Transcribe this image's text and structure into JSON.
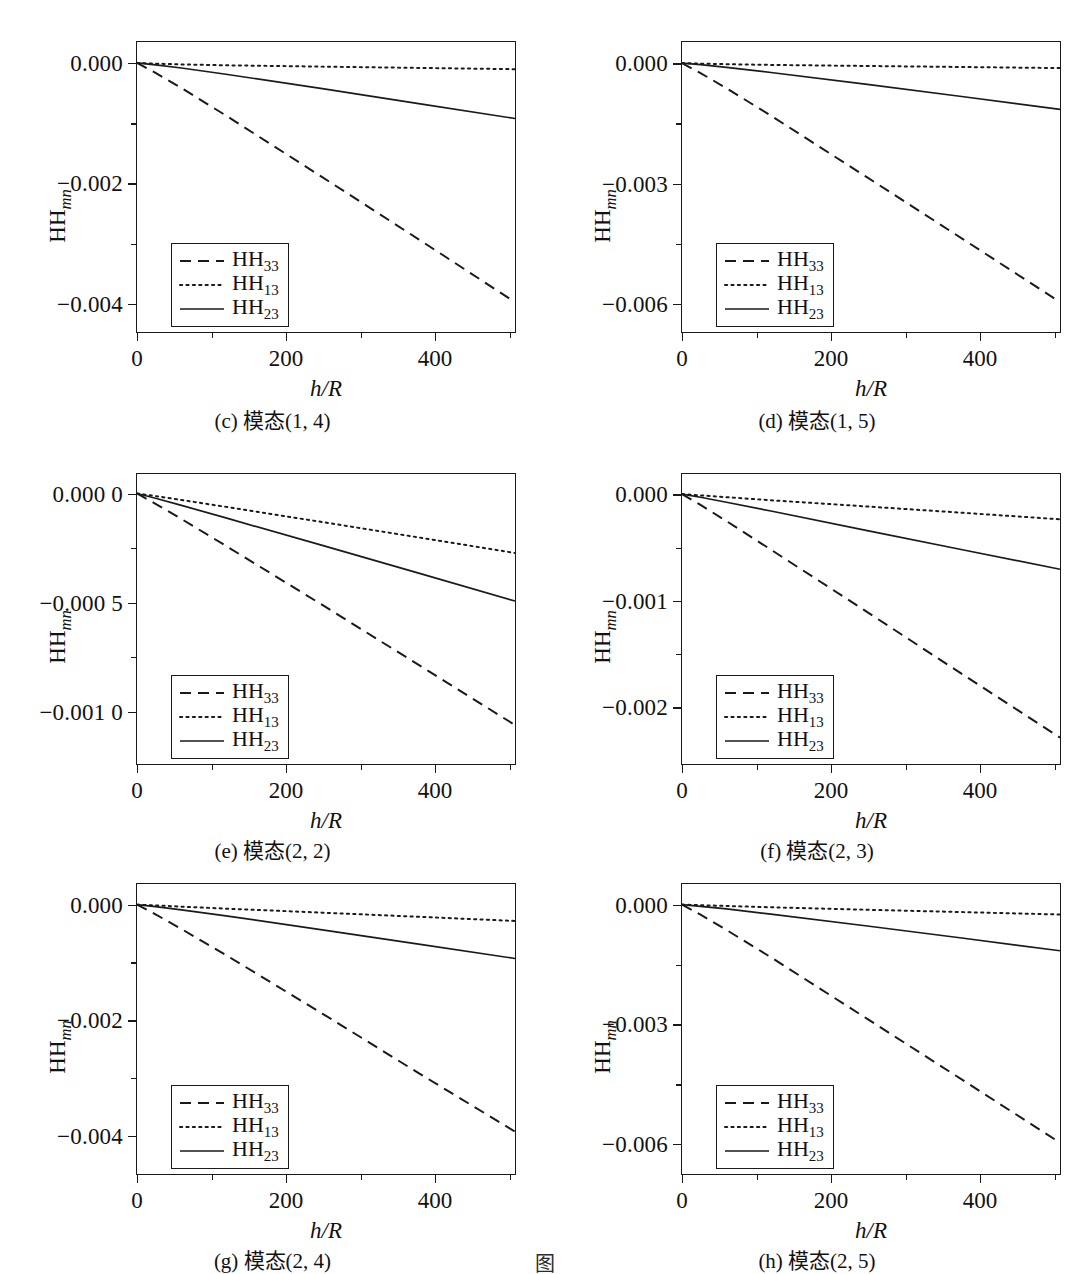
{
  "figure": {
    "bottom_caption": "图 ",
    "axis_y_title_base": "HH",
    "axis_y_title_sub": "mn",
    "axis_x_title": "h/R",
    "legend_labels": {
      "hh33_base": "HH",
      "hh33_sub": "33",
      "hh13_base": "HH",
      "hh13_sub": "13",
      "hh23_base": "HH",
      "hh23_sub": "23"
    },
    "line_color": "#1a1a1a"
  },
  "chart_data": [
    {
      "id": "c",
      "type": "line",
      "caption": "(c) 模态(1, 4)",
      "xlabel": "h/R",
      "ylabel": "HHmn",
      "xlim": [
        0,
        510
      ],
      "ylim": [
        -0.0045,
        0.00035
      ],
      "xticks": [
        0,
        200,
        400
      ],
      "xticklabels": [
        "0",
        "200",
        "400"
      ],
      "xminor": [
        100,
        300,
        500
      ],
      "yticks": [
        0.0,
        -0.002,
        -0.004
      ],
      "yticklabels": [
        "0.000",
        "−0.002",
        "−0.004"
      ],
      "yminor": [
        -0.001,
        -0.003
      ],
      "grid": false,
      "legend_position": "lower-left",
      "series": [
        {
          "name": "HH33",
          "style": "dashed",
          "x": [
            0,
            25,
            60,
            120,
            250,
            380,
            510
          ],
          "y": [
            0,
            -0.000165,
            -0.00042,
            -0.00088,
            -0.00191,
            -0.00295,
            -0.004
          ]
        },
        {
          "name": "HH13",
          "style": "dotted",
          "x": [
            0,
            25,
            60,
            120,
            250,
            380,
            510
          ],
          "y": [
            0,
            -1.2e-05,
            -2.5e-05,
            -4e-05,
            -6.2e-05,
            -8.3e-05,
            -0.000105
          ]
        },
        {
          "name": "HH23",
          "style": "solid",
          "x": [
            0,
            25,
            60,
            120,
            250,
            380,
            510
          ],
          "y": [
            0,
            -3.2e-05,
            -8.5e-05,
            -0.00019,
            -0.00043,
            -0.00068,
            -0.00093
          ]
        }
      ]
    },
    {
      "id": "d",
      "type": "line",
      "caption": "(d) 模态(1, 5)",
      "xlabel": "h/R",
      "ylabel": "HHmn",
      "xlim": [
        0,
        510
      ],
      "ylim": [
        -0.00675,
        0.00053
      ],
      "xticks": [
        0,
        200,
        400
      ],
      "xticklabels": [
        "0",
        "200",
        "400"
      ],
      "xminor": [
        100,
        300,
        500
      ],
      "yticks": [
        0.0,
        -0.003,
        -0.006
      ],
      "yticklabels": [
        "0.000",
        "−0.003",
        "−0.006"
      ],
      "yminor": [
        -0.0015,
        -0.0045
      ],
      "grid": false,
      "legend_position": "lower-left",
      "series": [
        {
          "name": "HH33",
          "style": "dashed",
          "x": [
            0,
            25,
            60,
            120,
            250,
            380,
            510
          ],
          "y": [
            0,
            -0.00025,
            -0.00063,
            -0.00132,
            -0.00287,
            -0.00443,
            -0.006
          ]
        },
        {
          "name": "HH13",
          "style": "dotted",
          "x": [
            0,
            25,
            60,
            120,
            250,
            380,
            510
          ],
          "y": [
            0,
            -1.3e-05,
            -2.7e-05,
            -4.5e-05,
            -7.2e-05,
            -9.8e-05,
            -0.000125
          ]
        },
        {
          "name": "HH23",
          "style": "solid",
          "x": [
            0,
            25,
            60,
            120,
            250,
            380,
            510
          ],
          "y": [
            0,
            -4e-05,
            -0.000105,
            -0.000235,
            -0.000535,
            -0.000845,
            -0.00116
          ]
        }
      ]
    },
    {
      "id": "e",
      "type": "line",
      "caption": "(e) 模态(2, 2)",
      "xlabel": "h/R",
      "ylabel": "HHmn",
      "xlim": [
        0,
        510
      ],
      "ylim": [
        -0.00125,
        9e-05
      ],
      "xticks": [
        0,
        200,
        400
      ],
      "xticklabels": [
        "0",
        "200",
        "400"
      ],
      "xminor": [
        100,
        300,
        500
      ],
      "yticks": [
        0.0,
        -0.0005,
        -0.001
      ],
      "yticklabels": [
        "0.000 0",
        "−0.000 5",
        "−0.001 0"
      ],
      "yminor": [
        -0.00025,
        -0.00075
      ],
      "grid": false,
      "legend_position": "lower-left",
      "series": [
        {
          "name": "HH33",
          "style": "dashed",
          "x": [
            0,
            25,
            60,
            120,
            250,
            380,
            510
          ],
          "y": [
            0,
            -4.8e-05,
            -0.000118,
            -0.000242,
            -0.000515,
            -0.000792,
            -0.00107
          ]
        },
        {
          "name": "HH13",
          "style": "dotted",
          "x": [
            0,
            25,
            60,
            120,
            250,
            380,
            510
          ],
          "y": [
            0,
            -1.2e-05,
            -3e-05,
            -6.2e-05,
            -0.000132,
            -0.000203,
            -0.000275
          ]
        },
        {
          "name": "HH23",
          "style": "solid",
          "x": [
            0,
            25,
            60,
            120,
            250,
            380,
            510
          ],
          "y": [
            0,
            -2.2e-05,
            -5.5e-05,
            -0.000113,
            -0.00024,
            -0.000368,
            -0.000497
          ]
        }
      ]
    },
    {
      "id": "f",
      "type": "line",
      "caption": "(f) 模态(2, 3)",
      "xlabel": "h/R",
      "ylabel": "HHmn",
      "xlim": [
        0,
        510
      ],
      "ylim": [
        -0.00255,
        0.00019
      ],
      "xticks": [
        0,
        200,
        400
      ],
      "xticklabels": [
        "0",
        "200",
        "400"
      ],
      "xminor": [
        100,
        300,
        500
      ],
      "yticks": [
        0.0,
        -0.001,
        -0.002
      ],
      "yticklabels": [
        "0.000",
        "−0.001",
        "−0.002"
      ],
      "yminor": [
        -0.0005,
        -0.0015
      ],
      "grid": false,
      "legend_position": "lower-left",
      "series": [
        {
          "name": "HH33",
          "style": "dashed",
          "x": [
            0,
            25,
            60,
            120,
            250,
            380,
            510
          ],
          "y": [
            0,
            -0.000102,
            -0.000255,
            -0.000525,
            -0.001115,
            -0.00171,
            -0.0023
          ]
        },
        {
          "name": "HH13",
          "style": "dotted",
          "x": [
            0,
            25,
            60,
            120,
            250,
            380,
            510
          ],
          "y": [
            0,
            -1.2e-05,
            -2.9e-05,
            -5.8e-05,
            -0.000117,
            -0.000177,
            -0.000238
          ]
        },
        {
          "name": "HH23",
          "style": "solid",
          "x": [
            0,
            25,
            60,
            120,
            250,
            380,
            510
          ],
          "y": [
            0,
            -3e-05,
            -7.7e-05,
            -0.00016,
            -0.000345,
            -0.000528,
            -0.00071
          ]
        }
      ]
    },
    {
      "id": "g",
      "type": "line",
      "caption": "(g) 模态(2, 4)",
      "xlabel": "h/R",
      "ylabel": "HHmn",
      "xlim": [
        0,
        510
      ],
      "ylim": [
        -0.0047,
        0.00036
      ],
      "xticks": [
        0,
        200,
        400
      ],
      "xticklabels": [
        "0",
        "200",
        "400"
      ],
      "xminor": [
        100,
        300,
        500
      ],
      "yticks": [
        0.0,
        -0.002,
        -0.004
      ],
      "yticklabels": [
        "0.000",
        "−0.002",
        "−0.004"
      ],
      "yminor": [
        -0.001,
        -0.003
      ],
      "grid": false,
      "legend_position": "lower-left",
      "series": [
        {
          "name": "HH33",
          "style": "dashed",
          "x": [
            0,
            25,
            60,
            120,
            250,
            380,
            510
          ],
          "y": [
            0,
            -0.00017,
            -0.000425,
            -0.00088,
            -0.0019,
            -0.00294,
            -0.00396
          ]
        },
        {
          "name": "HH13",
          "style": "dotted",
          "x": [
            0,
            25,
            60,
            120,
            250,
            380,
            510
          ],
          "y": [
            0,
            -1.4e-05,
            -3.5e-05,
            -7e-05,
            -0.00014,
            -0.000212,
            -0.000285
          ]
        },
        {
          "name": "HH23",
          "style": "solid",
          "x": [
            0,
            25,
            60,
            120,
            250,
            380,
            510
          ],
          "y": [
            0,
            -3.4e-05,
            -9e-05,
            -0.000195,
            -0.00044,
            -0.00069,
            -0.00094
          ]
        }
      ]
    },
    {
      "id": "h",
      "type": "line",
      "caption": "(h) 模态(2, 5)",
      "xlabel": "h/R",
      "ylabel": "HHmn",
      "xlim": [
        0,
        510
      ],
      "ylim": [
        -0.0068,
        0.00052
      ],
      "xticks": [
        0,
        200,
        400
      ],
      "xticklabels": [
        "0",
        "200",
        "400"
      ],
      "xminor": [
        100,
        300,
        500
      ],
      "yticks": [
        0.0,
        -0.003,
        -0.006
      ],
      "yticklabels": [
        "0.000",
        "−0.003",
        "−0.006"
      ],
      "yminor": [
        -0.0015,
        -0.0045
      ],
      "grid": false,
      "legend_position": "lower-left",
      "series": [
        {
          "name": "HH33",
          "style": "dashed",
          "x": [
            0,
            25,
            60,
            120,
            250,
            380,
            510
          ],
          "y": [
            0,
            -0.000255,
            -0.00064,
            -0.00133,
            -0.002885,
            -0.004445,
            -0.00601
          ]
        },
        {
          "name": "HH13",
          "style": "dotted",
          "x": [
            0,
            25,
            60,
            120,
            250,
            380,
            510
          ],
          "y": [
            0,
            -1.5e-05,
            -3.5e-05,
            -6.8e-05,
            -0.00013,
            -0.00019,
            -0.00025
          ]
        },
        {
          "name": "HH23",
          "style": "solid",
          "x": [
            0,
            25,
            60,
            120,
            250,
            380,
            510
          ],
          "y": [
            0,
            -4.3e-05,
            -0.00011,
            -0.00024,
            -0.00054,
            -0.00085,
            -0.001165
          ]
        }
      ]
    }
  ]
}
